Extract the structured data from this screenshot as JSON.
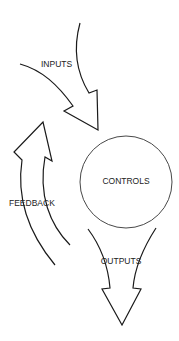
{
  "diagram": {
    "nodes": [
      {
        "id": "controls",
        "label": "CONTROLS",
        "shape": "circle"
      }
    ],
    "arrows": [
      {
        "id": "inputs",
        "label": "INPUTS",
        "direction": "into controls from upper-left"
      },
      {
        "id": "outputs",
        "label": "OUTPUTS",
        "direction": "down from controls"
      },
      {
        "id": "feedback",
        "label": "FEEDBACK",
        "direction": "up along left side back toward inputs"
      }
    ],
    "colors": {
      "line": "#1a1a1a",
      "background": "#ffffff"
    }
  }
}
